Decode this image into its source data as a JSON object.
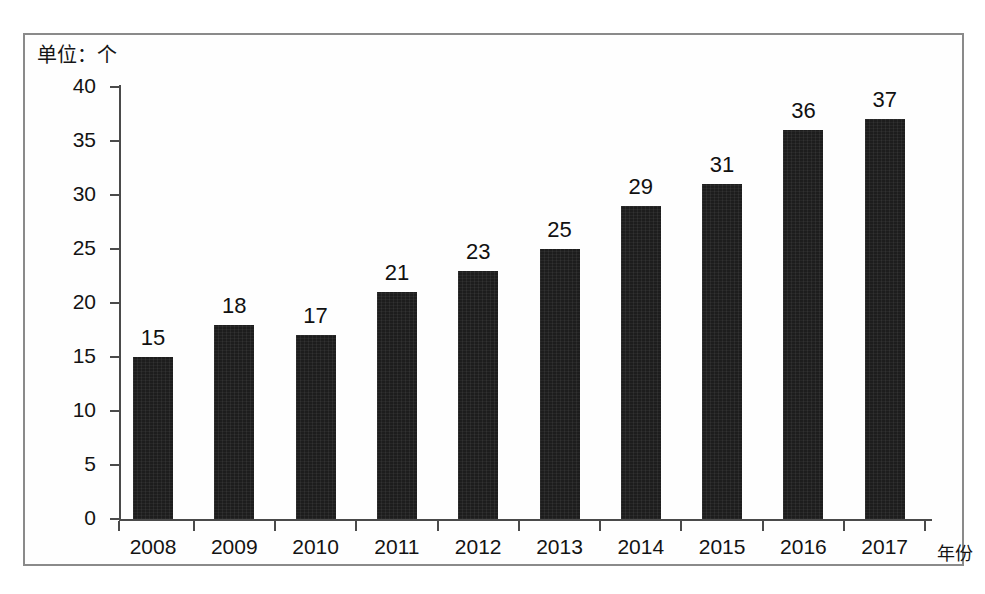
{
  "figure": {
    "unit_label": "单位：个",
    "frame_color": "#8a8a8a",
    "background": "#ffffff",
    "bar_color": "#1d1d1d"
  },
  "chart_data": {
    "type": "bar",
    "title": "",
    "subtitle": "",
    "unit_note": "单位：个",
    "xlabel": "年份",
    "ylabel": "",
    "categories": [
      "2008",
      "2009",
      "2010",
      "2011",
      "2012",
      "2013",
      "2014",
      "2015",
      "2016",
      "2017"
    ],
    "values": [
      15,
      18,
      17,
      21,
      23,
      25,
      29,
      31,
      36,
      37
    ],
    "data_labels": [
      "15",
      "18",
      "17",
      "21",
      "23",
      "25",
      "29",
      "31",
      "36",
      "37"
    ],
    "ylim": [
      0,
      40
    ],
    "ytick_values": [
      0,
      5,
      10,
      15,
      20,
      25,
      30,
      35,
      40
    ],
    "ytick_labels": [
      "0",
      "5",
      "10",
      "15",
      "20",
      "25",
      "30",
      "35",
      "40"
    ],
    "grid": false,
    "legend": null,
    "legend_position": "none",
    "series": [
      {
        "name": "",
        "values": [
          15,
          18,
          17,
          21,
          23,
          25,
          29,
          31,
          36,
          37
        ],
        "color": "#1d1d1d"
      }
    ]
  }
}
